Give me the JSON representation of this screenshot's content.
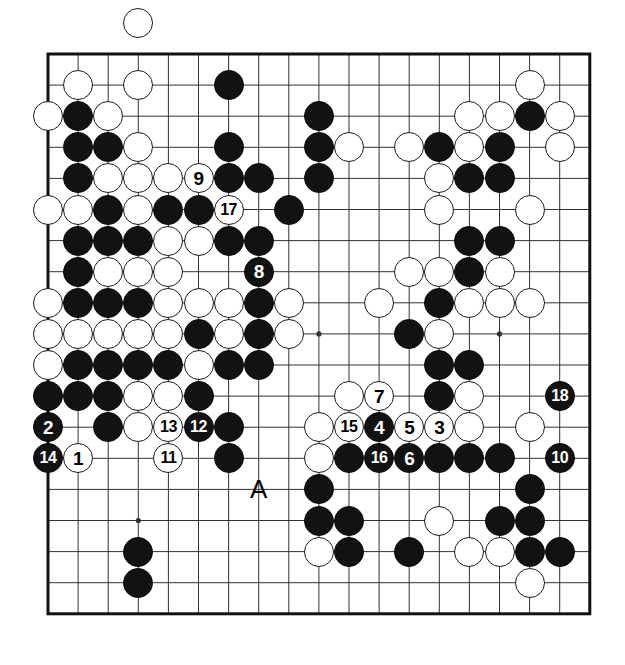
{
  "diagram": {
    "type": "go-board-diagram",
    "board_size": 19,
    "geometry": {
      "origin_x": 48,
      "origin_y": 54,
      "step_x": 30.1,
      "step_y": 31.1,
      "stone_diameter": 30,
      "line_color": "#333333",
      "border_color": "#111111",
      "background": "#ffffff",
      "black_color": "#121212",
      "white_color": "#ffffff"
    },
    "star_points": [
      [
        3,
        3
      ],
      [
        9,
        3
      ],
      [
        15,
        3
      ],
      [
        3,
        9
      ],
      [
        9,
        9
      ],
      [
        15,
        9
      ],
      [
        3,
        15
      ],
      [
        9,
        15
      ],
      [
        15,
        15
      ]
    ],
    "markers": [
      {
        "label": "A",
        "col": 7,
        "row": 14,
        "name": "marker-a"
      }
    ],
    "stones": [
      {
        "c": 3,
        "r": -1,
        "color": "white"
      },
      {
        "c": 1,
        "r": 1,
        "color": "white"
      },
      {
        "c": 3,
        "r": 1,
        "color": "white"
      },
      {
        "c": 6,
        "r": 1,
        "color": "black"
      },
      {
        "c": 16,
        "r": 1,
        "color": "white"
      },
      {
        "c": 0,
        "r": 2,
        "color": "white"
      },
      {
        "c": 1,
        "r": 2,
        "color": "black"
      },
      {
        "c": 2,
        "r": 2,
        "color": "white"
      },
      {
        "c": 9,
        "r": 2,
        "color": "black"
      },
      {
        "c": 14,
        "r": 2,
        "color": "white"
      },
      {
        "c": 15,
        "r": 2,
        "color": "white"
      },
      {
        "c": 16,
        "r": 2,
        "color": "black"
      },
      {
        "c": 17,
        "r": 2,
        "color": "white"
      },
      {
        "c": 1,
        "r": 3,
        "color": "black"
      },
      {
        "c": 2,
        "r": 3,
        "color": "black"
      },
      {
        "c": 3,
        "r": 3,
        "color": "white"
      },
      {
        "c": 6,
        "r": 3,
        "color": "black"
      },
      {
        "c": 9,
        "r": 3,
        "color": "black"
      },
      {
        "c": 10,
        "r": 3,
        "color": "white"
      },
      {
        "c": 12,
        "r": 3,
        "color": "white"
      },
      {
        "c": 13,
        "r": 3,
        "color": "black"
      },
      {
        "c": 14,
        "r": 3,
        "color": "white"
      },
      {
        "c": 15,
        "r": 3,
        "color": "black"
      },
      {
        "c": 17,
        "r": 3,
        "color": "white"
      },
      {
        "c": 1,
        "r": 4,
        "color": "black"
      },
      {
        "c": 2,
        "r": 4,
        "color": "white"
      },
      {
        "c": 3,
        "r": 4,
        "color": "white"
      },
      {
        "c": 4,
        "r": 4,
        "color": "white"
      },
      {
        "c": 5,
        "r": 4,
        "color": "white",
        "label": "9"
      },
      {
        "c": 6,
        "r": 4,
        "color": "black"
      },
      {
        "c": 7,
        "r": 4,
        "color": "black"
      },
      {
        "c": 9,
        "r": 4,
        "color": "black"
      },
      {
        "c": 13,
        "r": 4,
        "color": "white"
      },
      {
        "c": 14,
        "r": 4,
        "color": "black"
      },
      {
        "c": 15,
        "r": 4,
        "color": "black"
      },
      {
        "c": 0,
        "r": 5,
        "color": "white"
      },
      {
        "c": 1,
        "r": 5,
        "color": "white"
      },
      {
        "c": 2,
        "r": 5,
        "color": "black"
      },
      {
        "c": 3,
        "r": 5,
        "color": "white"
      },
      {
        "c": 4,
        "r": 5,
        "color": "black"
      },
      {
        "c": 5,
        "r": 5,
        "color": "black"
      },
      {
        "c": 6,
        "r": 5,
        "color": "white",
        "label": "17"
      },
      {
        "c": 8,
        "r": 5,
        "color": "black"
      },
      {
        "c": 13,
        "r": 5,
        "color": "white"
      },
      {
        "c": 16,
        "r": 5,
        "color": "white"
      },
      {
        "c": 1,
        "r": 6,
        "color": "black"
      },
      {
        "c": 2,
        "r": 6,
        "color": "black"
      },
      {
        "c": 3,
        "r": 6,
        "color": "black"
      },
      {
        "c": 4,
        "r": 6,
        "color": "white"
      },
      {
        "c": 5,
        "r": 6,
        "color": "white"
      },
      {
        "c": 6,
        "r": 6,
        "color": "black"
      },
      {
        "c": 7,
        "r": 6,
        "color": "black"
      },
      {
        "c": 14,
        "r": 6,
        "color": "black"
      },
      {
        "c": 15,
        "r": 6,
        "color": "black"
      },
      {
        "c": 1,
        "r": 7,
        "color": "black"
      },
      {
        "c": 2,
        "r": 7,
        "color": "white"
      },
      {
        "c": 3,
        "r": 7,
        "color": "white"
      },
      {
        "c": 4,
        "r": 7,
        "color": "white"
      },
      {
        "c": 7,
        "r": 7,
        "color": "black",
        "label": "8"
      },
      {
        "c": 12,
        "r": 7,
        "color": "white"
      },
      {
        "c": 13,
        "r": 7,
        "color": "white"
      },
      {
        "c": 14,
        "r": 7,
        "color": "black"
      },
      {
        "c": 15,
        "r": 7,
        "color": "white"
      },
      {
        "c": 0,
        "r": 8,
        "color": "white"
      },
      {
        "c": 1,
        "r": 8,
        "color": "black"
      },
      {
        "c": 2,
        "r": 8,
        "color": "black"
      },
      {
        "c": 3,
        "r": 8,
        "color": "black"
      },
      {
        "c": 4,
        "r": 8,
        "color": "white"
      },
      {
        "c": 5,
        "r": 8,
        "color": "white"
      },
      {
        "c": 6,
        "r": 8,
        "color": "white"
      },
      {
        "c": 7,
        "r": 8,
        "color": "black"
      },
      {
        "c": 8,
        "r": 8,
        "color": "white"
      },
      {
        "c": 11,
        "r": 8,
        "color": "white"
      },
      {
        "c": 13,
        "r": 8,
        "color": "black"
      },
      {
        "c": 14,
        "r": 8,
        "color": "white"
      },
      {
        "c": 15,
        "r": 8,
        "color": "white"
      },
      {
        "c": 16,
        "r": 8,
        "color": "white"
      },
      {
        "c": 0,
        "r": 9,
        "color": "white"
      },
      {
        "c": 1,
        "r": 9,
        "color": "white"
      },
      {
        "c": 2,
        "r": 9,
        "color": "white"
      },
      {
        "c": 3,
        "r": 9,
        "color": "white"
      },
      {
        "c": 4,
        "r": 9,
        "color": "white"
      },
      {
        "c": 5,
        "r": 9,
        "color": "black"
      },
      {
        "c": 6,
        "r": 9,
        "color": "white"
      },
      {
        "c": 7,
        "r": 9,
        "color": "black"
      },
      {
        "c": 8,
        "r": 9,
        "color": "white"
      },
      {
        "c": 12,
        "r": 9,
        "color": "black"
      },
      {
        "c": 13,
        "r": 9,
        "color": "white"
      },
      {
        "c": 0,
        "r": 10,
        "color": "white"
      },
      {
        "c": 1,
        "r": 10,
        "color": "black"
      },
      {
        "c": 2,
        "r": 10,
        "color": "black"
      },
      {
        "c": 3,
        "r": 10,
        "color": "black"
      },
      {
        "c": 4,
        "r": 10,
        "color": "black"
      },
      {
        "c": 5,
        "r": 10,
        "color": "white"
      },
      {
        "c": 6,
        "r": 10,
        "color": "black"
      },
      {
        "c": 7,
        "r": 10,
        "color": "black"
      },
      {
        "c": 13,
        "r": 10,
        "color": "black"
      },
      {
        "c": 14,
        "r": 10,
        "color": "black"
      },
      {
        "c": 0,
        "r": 11,
        "color": "black"
      },
      {
        "c": 1,
        "r": 11,
        "color": "black"
      },
      {
        "c": 2,
        "r": 11,
        "color": "black"
      },
      {
        "c": 3,
        "r": 11,
        "color": "white"
      },
      {
        "c": 4,
        "r": 11,
        "color": "white"
      },
      {
        "c": 5,
        "r": 11,
        "color": "black"
      },
      {
        "c": 10,
        "r": 11,
        "color": "white"
      },
      {
        "c": 11,
        "r": 11,
        "color": "white",
        "label": "7"
      },
      {
        "c": 13,
        "r": 11,
        "color": "black"
      },
      {
        "c": 14,
        "r": 11,
        "color": "white"
      },
      {
        "c": 17,
        "r": 11,
        "color": "black",
        "label": "18"
      },
      {
        "c": 0,
        "r": 12,
        "color": "black",
        "label": "2"
      },
      {
        "c": 2,
        "r": 12,
        "color": "black"
      },
      {
        "c": 3,
        "r": 12,
        "color": "white"
      },
      {
        "c": 4,
        "r": 12,
        "color": "white",
        "label": "13"
      },
      {
        "c": 5,
        "r": 12,
        "color": "black",
        "label": "12"
      },
      {
        "c": 6,
        "r": 12,
        "color": "black"
      },
      {
        "c": 9,
        "r": 12,
        "color": "white"
      },
      {
        "c": 10,
        "r": 12,
        "color": "white",
        "label": "15"
      },
      {
        "c": 11,
        "r": 12,
        "color": "black",
        "label": "4"
      },
      {
        "c": 12,
        "r": 12,
        "color": "white",
        "label": "5"
      },
      {
        "c": 13,
        "r": 12,
        "color": "white",
        "label": "3"
      },
      {
        "c": 14,
        "r": 12,
        "color": "white"
      },
      {
        "c": 16,
        "r": 12,
        "color": "white"
      },
      {
        "c": 0,
        "r": 13,
        "color": "black",
        "label": "14"
      },
      {
        "c": 1,
        "r": 13,
        "color": "white",
        "label": "1"
      },
      {
        "c": 4,
        "r": 13,
        "color": "white",
        "label": "11"
      },
      {
        "c": 6,
        "r": 13,
        "color": "black"
      },
      {
        "c": 9,
        "r": 13,
        "color": "white"
      },
      {
        "c": 10,
        "r": 13,
        "color": "black"
      },
      {
        "c": 11,
        "r": 13,
        "color": "black",
        "label": "16"
      },
      {
        "c": 12,
        "r": 13,
        "color": "black",
        "label": "6"
      },
      {
        "c": 13,
        "r": 13,
        "color": "black"
      },
      {
        "c": 14,
        "r": 13,
        "color": "black"
      },
      {
        "c": 15,
        "r": 13,
        "color": "black"
      },
      {
        "c": 17,
        "r": 13,
        "color": "black",
        "label": "10"
      },
      {
        "c": 9,
        "r": 14,
        "color": "black"
      },
      {
        "c": 16,
        "r": 14,
        "color": "black"
      },
      {
        "c": 9,
        "r": 15,
        "color": "black"
      },
      {
        "c": 10,
        "r": 15,
        "color": "black"
      },
      {
        "c": 13,
        "r": 15,
        "color": "white"
      },
      {
        "c": 15,
        "r": 15,
        "color": "black"
      },
      {
        "c": 16,
        "r": 15,
        "color": "black"
      },
      {
        "c": 3,
        "r": 16,
        "color": "black"
      },
      {
        "c": 9,
        "r": 16,
        "color": "white"
      },
      {
        "c": 10,
        "r": 16,
        "color": "black"
      },
      {
        "c": 12,
        "r": 16,
        "color": "black"
      },
      {
        "c": 14,
        "r": 16,
        "color": "white"
      },
      {
        "c": 15,
        "r": 16,
        "color": "white"
      },
      {
        "c": 16,
        "r": 16,
        "color": "black"
      },
      {
        "c": 17,
        "r": 16,
        "color": "black"
      },
      {
        "c": 3,
        "r": 17,
        "color": "black"
      },
      {
        "c": 16,
        "r": 17,
        "color": "white"
      }
    ]
  }
}
